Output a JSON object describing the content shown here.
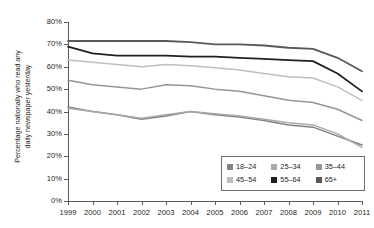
{
  "chart_data": {
    "type": "line",
    "title": "",
    "xlabel": "",
    "ylabel": "Percentage nationally who read any\ndaily newspaper yesterday",
    "x": [
      1999,
      2000,
      2001,
      2002,
      2003,
      2004,
      2005,
      2006,
      2007,
      2008,
      2009,
      2010,
      2011
    ],
    "xlim": [
      1999,
      2011
    ],
    "ylim": [
      0,
      80
    ],
    "yticks": [
      0,
      10,
      20,
      30,
      40,
      50,
      60,
      70,
      80
    ],
    "ytick_labels": [
      "0%",
      "10%",
      "20%",
      "30%",
      "40%",
      "50%",
      "60%",
      "70%",
      "80%"
    ],
    "xtick_labels": [
      "1999",
      "2000",
      "2001",
      "2002",
      "2003",
      "2004",
      "2005",
      "2006",
      "2007",
      "2008",
      "2009",
      "2010",
      "2011"
    ],
    "grid": false,
    "legend_position": "lower-right",
    "series": [
      {
        "name": "18–24",
        "color": "#808285",
        "width": 1.5,
        "values": [
          42,
          40,
          38.5,
          36.5,
          38,
          40,
          38.5,
          37.5,
          36,
          34,
          33,
          29,
          25
        ]
      },
      {
        "name": "25–34",
        "color": "#a7a9ac",
        "width": 1.5,
        "values": [
          41.5,
          40,
          38.5,
          37,
          38.5,
          40,
          39,
          38,
          36.5,
          35,
          34,
          30,
          24
        ]
      },
      {
        "name": "35–44",
        "color": "#939598",
        "width": 1.5,
        "values": [
          54,
          52,
          51,
          50,
          52,
          51.5,
          50,
          49,
          47,
          45,
          44,
          41,
          36
        ]
      },
      {
        "name": "45–54",
        "color": "#bcbec0",
        "width": 1.5,
        "values": [
          63,
          62,
          61,
          60,
          61,
          60.5,
          59.5,
          58.5,
          57,
          55.5,
          55,
          51,
          45
        ]
      },
      {
        "name": "55–64",
        "color": "#231f20",
        "width": 1.8,
        "values": [
          69,
          66,
          65,
          65,
          65,
          64.5,
          64.5,
          64,
          63.5,
          63,
          62.5,
          57,
          49
        ]
      },
      {
        "name": "65+",
        "color": "#58595b",
        "width": 1.8,
        "values": [
          71.5,
          71.5,
          71.5,
          71.5,
          71.5,
          71,
          70,
          70,
          69.5,
          68.5,
          68,
          64,
          58
        ]
      }
    ]
  },
  "legend": {
    "items": [
      {
        "label": "18–24",
        "color": "#808285"
      },
      {
        "label": "25–34",
        "color": "#a7a9ac"
      },
      {
        "label": "35–44",
        "color": "#939598"
      },
      {
        "label": "45–54",
        "color": "#bcbec0"
      },
      {
        "label": "55–64",
        "color": "#231f20"
      },
      {
        "label": "65+",
        "color": "#58595b"
      }
    ]
  }
}
